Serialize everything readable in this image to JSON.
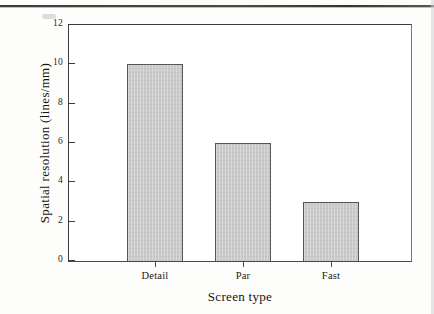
{
  "chart_data": {
    "type": "bar",
    "title": "",
    "subtitle": "",
    "categories": [
      "Detail",
      "Par",
      "Fast"
    ],
    "values": [
      10,
      6,
      3
    ],
    "series": [
      {
        "name": "Spatial resolution",
        "values": [
          10,
          6,
          3
        ]
      }
    ],
    "xlabel": "Screen type",
    "ylabel": "Spatial resolution (lines/mm)",
    "ylim": [
      0,
      12
    ],
    "ytick_labels": [
      "0",
      "2",
      "4",
      "6",
      "8",
      "10",
      "12"
    ],
    "ytick_values": [
      0,
      2,
      4,
      6,
      8,
      10,
      12
    ],
    "grid": false,
    "legend": false,
    "legend_position": "none",
    "annotations": [],
    "colors": {
      "bar_fill": "#c9c9c9",
      "bar_edge": "#555555",
      "axis": "#3d3d3d",
      "text": "#131313",
      "background": "#ffffff",
      "page": "#fdfdfc"
    }
  }
}
